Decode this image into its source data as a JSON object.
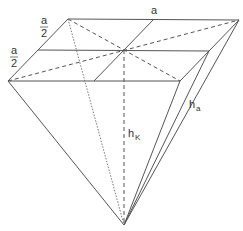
{
  "diagram": {
    "labels": {
      "base_edge": "a",
      "half_edge_1_num": "a",
      "half_edge_1_den": "2",
      "half_edge_2_num": "a",
      "half_edge_2_den": "2",
      "slant_height_main": "h",
      "slant_height_sub": "a",
      "height_main": "h",
      "height_sub": "K"
    },
    "colors": {
      "line": "#555555",
      "text": "#333333",
      "background": "#ffffff"
    },
    "vertices": {
      "top_left": [
        68,
        19
      ],
      "top_right": [
        239,
        20
      ],
      "bottom_left": [
        8,
        81
      ],
      "bottom_right": [
        180,
        81
      ],
      "center": [
        124,
        50
      ],
      "apex": [
        124,
        225
      ]
    }
  }
}
